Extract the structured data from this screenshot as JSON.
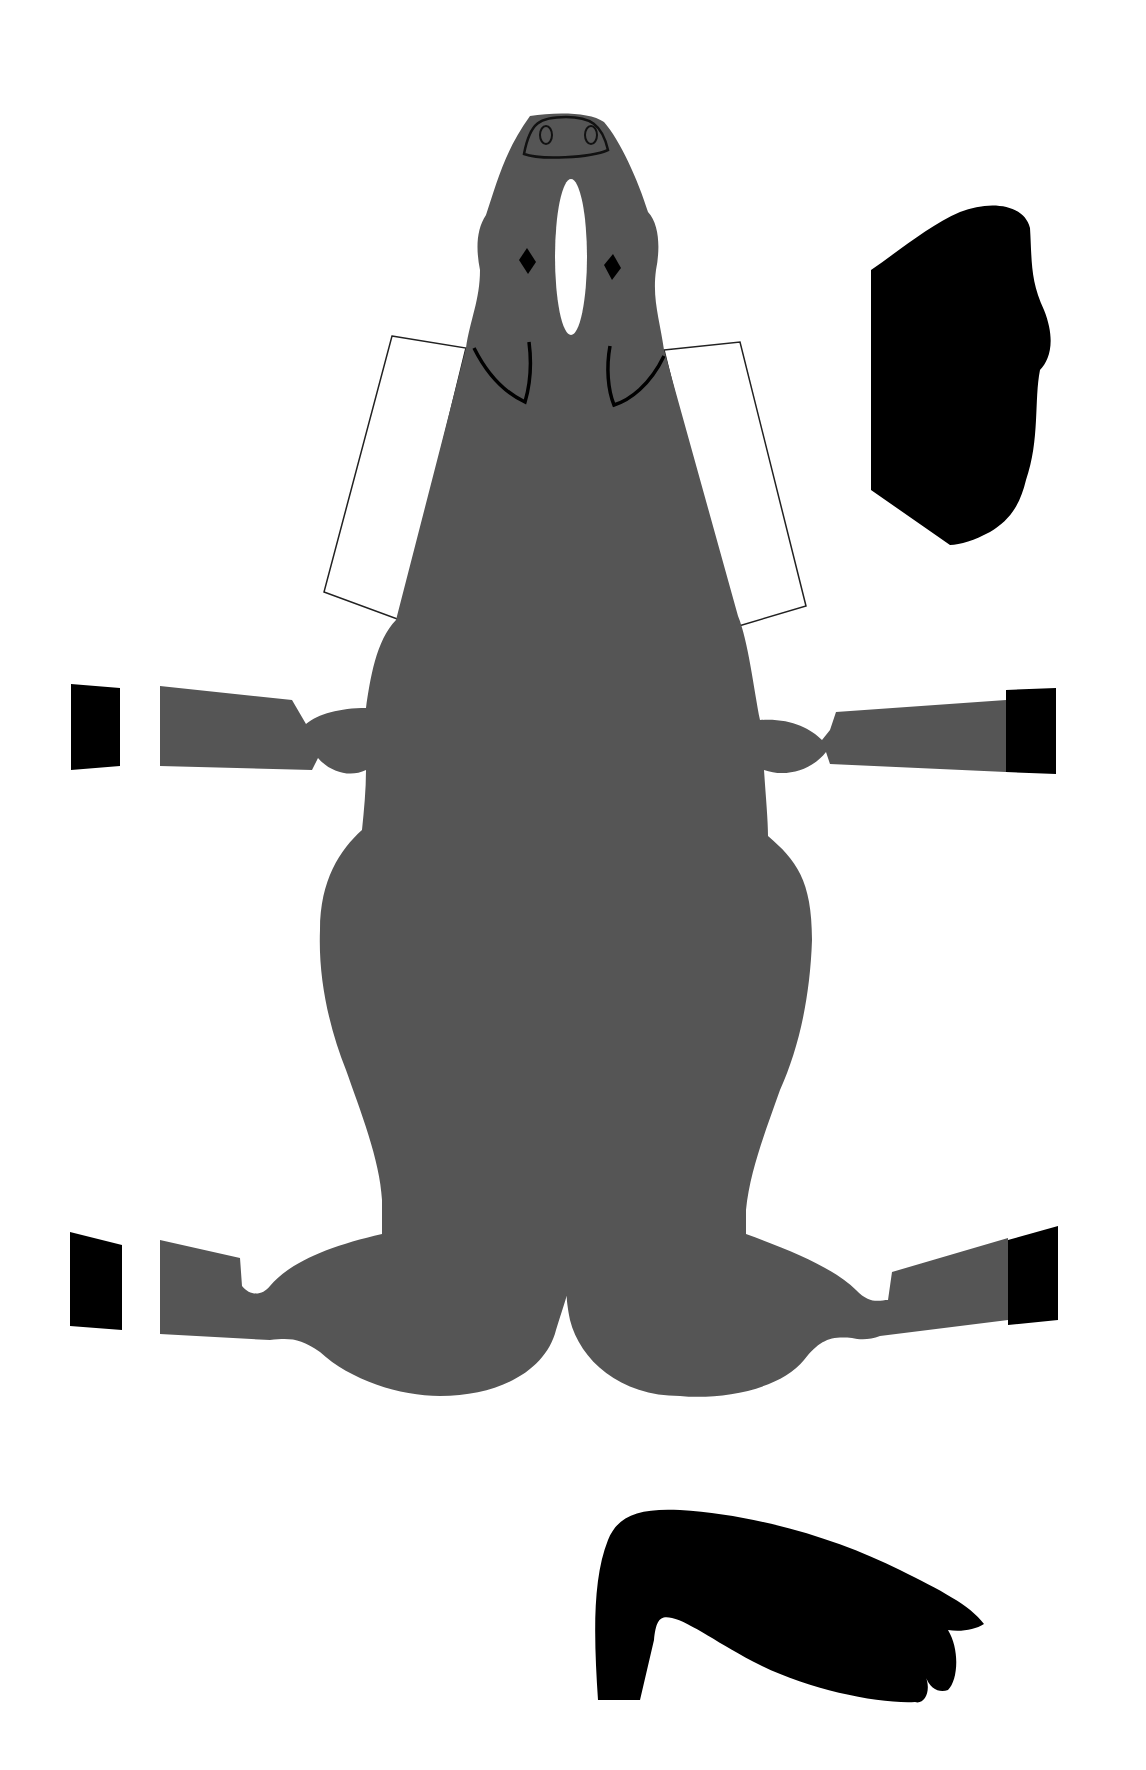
{
  "colors": {
    "background": "#ffffff",
    "body": "#555555",
    "hoof": "#000000",
    "mane": "#000000",
    "tail": "#000000",
    "outline": "#222222",
    "tab": "#ffffff"
  },
  "pieces": {
    "body": {
      "label": "Horse body",
      "fill": "#555555"
    },
    "tab_left": {
      "label": "Left glue tab"
    },
    "tab_right": {
      "label": "Right glue tab"
    },
    "mane": {
      "label": "Mane piece"
    },
    "tail": {
      "label": "Tail piece"
    },
    "hoof_front_left": {
      "label": "Front left hoof"
    },
    "hoof_front_right": {
      "label": "Front right hoof"
    },
    "hoof_back_left": {
      "label": "Back left hoof"
    },
    "hoof_back_right": {
      "label": "Back right hoof"
    },
    "blaze": {
      "label": "White blaze"
    },
    "eye_left": {
      "label": "Left eye"
    },
    "eye_right": {
      "label": "Right eye"
    },
    "nose": {
      "label": "Muzzle"
    }
  }
}
